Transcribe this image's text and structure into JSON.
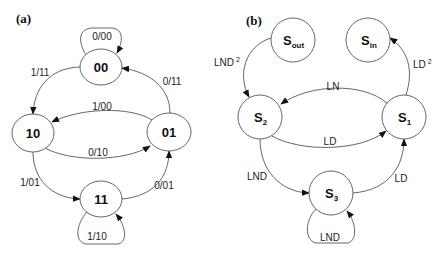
{
  "panel_a": {
    "label": "(a)",
    "states": [
      {
        "id": "00",
        "label": "00"
      },
      {
        "id": "10",
        "label": "10"
      },
      {
        "id": "01",
        "label": "01"
      },
      {
        "id": "11",
        "label": "11"
      }
    ],
    "transitions": [
      {
        "from": "00",
        "to": "00",
        "label": "0/00"
      },
      {
        "from": "00",
        "to": "10",
        "label": "1/11"
      },
      {
        "from": "01",
        "to": "00",
        "label": "0/11"
      },
      {
        "from": "01",
        "to": "10",
        "label": "1/00"
      },
      {
        "from": "10",
        "to": "01",
        "label": "0/10"
      },
      {
        "from": "10",
        "to": "11",
        "label": "1/01"
      },
      {
        "from": "11",
        "to": "01",
        "label": "0/01"
      },
      {
        "from": "11",
        "to": "11",
        "label": "1/10"
      }
    ]
  },
  "panel_b": {
    "label": "(b)",
    "states": [
      {
        "id": "S_out",
        "base": "S",
        "sub": "out"
      },
      {
        "id": "S_in",
        "base": "S",
        "sub": "in"
      },
      {
        "id": "S_2",
        "base": "S",
        "sub": "2"
      },
      {
        "id": "S_1",
        "base": "S",
        "sub": "1"
      },
      {
        "id": "S_3",
        "base": "S",
        "sub": "3"
      }
    ],
    "transitions": [
      {
        "from": "S_out",
        "to": "S_2",
        "base": "LND",
        "sup": "2"
      },
      {
        "from": "S_1",
        "to": "S_in",
        "base": "LD",
        "sup": "2"
      },
      {
        "from": "S_1",
        "to": "S_2",
        "label": "LN"
      },
      {
        "from": "S_2",
        "to": "S_1",
        "label": "LD"
      },
      {
        "from": "S_2",
        "to": "S_3",
        "label": "LND"
      },
      {
        "from": "S_3",
        "to": "S_1",
        "label": "LD"
      },
      {
        "from": "S_3",
        "to": "S_3",
        "label": "LND"
      }
    ]
  },
  "colors": {
    "stroke": "#555555",
    "text": "#111111",
    "background": "#ffffff"
  }
}
